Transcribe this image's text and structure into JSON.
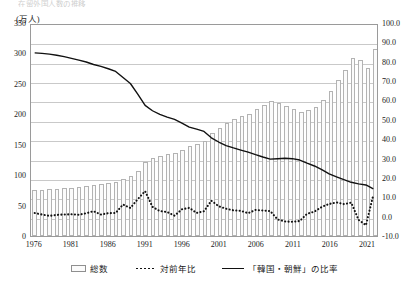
{
  "title": "在留外国人数の推移",
  "axes": {
    "left_unit": "(万人)",
    "left_ticks": [
      "350",
      "300",
      "250",
      "200",
      "150",
      "100",
      "50",
      "0"
    ],
    "right_ticks": [
      "100.0",
      "90.0",
      "80.0",
      "70.0",
      "60.0",
      "50.0",
      "40.0",
      "30.0",
      "20.0",
      "10.0",
      "0.0",
      "-10.0"
    ],
    "x_ticks": [
      "1976",
      "1981",
      "1986",
      "1991",
      "1996",
      "2001",
      "2006",
      "2011",
      "2016",
      "2021"
    ]
  },
  "legend": {
    "bars_label": "総数",
    "dotted_label": "対前年比",
    "solid_label": "「韓国・朝鮮」の比率"
  },
  "colors": {
    "bar_fill": "#fbfbfb",
    "bar_stroke": "#b3b3b3",
    "dotted_line": "#111111",
    "solid_line": "#111111",
    "grid": "#c9c9c9",
    "frame": "#9a9a9a"
  },
  "chart_data": {
    "type": "bar",
    "title": "在留外国人数の推移",
    "xlabel": "",
    "ylabel": "総数（万人）",
    "y2label": "比率・対前年比（％）",
    "ylim": [
      0,
      350
    ],
    "y2lim": [
      -10,
      100
    ],
    "grid": true,
    "legend_position": "bottom",
    "categories": [
      1976,
      1977,
      1978,
      1979,
      1980,
      1981,
      1982,
      1983,
      1984,
      1985,
      1986,
      1987,
      1988,
      1989,
      1990,
      1991,
      1992,
      1993,
      1994,
      1995,
      1996,
      1997,
      1998,
      1999,
      2000,
      2001,
      2002,
      2003,
      2004,
      2005,
      2006,
      2007,
      2008,
      2009,
      2010,
      2011,
      2012,
      2013,
      2014,
      2015,
      2016,
      2017,
      2018,
      2019,
      2020,
      2021,
      2022
    ],
    "series": [
      {
        "name": "総数",
        "type": "bar",
        "axis": "left",
        "unit": "万人",
        "values": [
          75.3,
          76.2,
          76.6,
          77.4,
          78.3,
          79.3,
          80.2,
          81.7,
          84.1,
          85.1,
          86.7,
          88.4,
          94.1,
          98.4,
          107.5,
          121.9,
          128.2,
          132.1,
          135.4,
          136.2,
          141.5,
          148.2,
          151.2,
          155.6,
          168.6,
          177.8,
          185.2,
          191.5,
          197.4,
          201.2,
          208.5,
          215.3,
          221.7,
          218.6,
          213.4,
          207.9,
          203.4,
          206.6,
          212.2,
          223.2,
          238.3,
          256.2,
          273.1,
          293.3,
          288.7,
          276.1,
          307.5
        ]
      },
      {
        "name": "対前年比",
        "type": "line",
        "style": "dotted",
        "axis": "right",
        "unit": "%",
        "values": [
          2.0,
          1.2,
          0.5,
          1.0,
          1.2,
          1.3,
          1.1,
          1.9,
          2.9,
          1.2,
          1.9,
          2.0,
          6.4,
          4.6,
          9.2,
          13.4,
          5.2,
          3.0,
          2.5,
          0.6,
          3.9,
          4.7,
          2.0,
          2.9,
          8.4,
          5.5,
          4.2,
          3.4,
          3.1,
          1.9,
          3.6,
          3.3,
          3.0,
          -1.4,
          -2.4,
          -2.6,
          -2.2,
          1.6,
          2.7,
          5.2,
          6.7,
          7.5,
          6.6,
          7.4,
          -1.6,
          -4.4,
          11.4
        ]
      },
      {
        "name": "「韓国・朝鮮」の比率",
        "type": "line",
        "style": "solid",
        "axis": "right",
        "unit": "%",
        "values": [
          85.5,
          85.2,
          84.8,
          84.2,
          83.5,
          82.6,
          81.7,
          80.7,
          79.4,
          78.4,
          77.2,
          75.8,
          72.6,
          69.5,
          64.0,
          58.1,
          55.3,
          53.4,
          52.0,
          50.8,
          48.9,
          46.8,
          45.7,
          44.5,
          41.2,
          39.0,
          37.1,
          35.9,
          34.8,
          33.7,
          32.4,
          31.2,
          30.1,
          30.3,
          30.5,
          30.3,
          29.6,
          28.0,
          26.5,
          24.6,
          22.4,
          20.8,
          19.4,
          18.0,
          17.2,
          16.6,
          14.6
        ]
      }
    ]
  }
}
